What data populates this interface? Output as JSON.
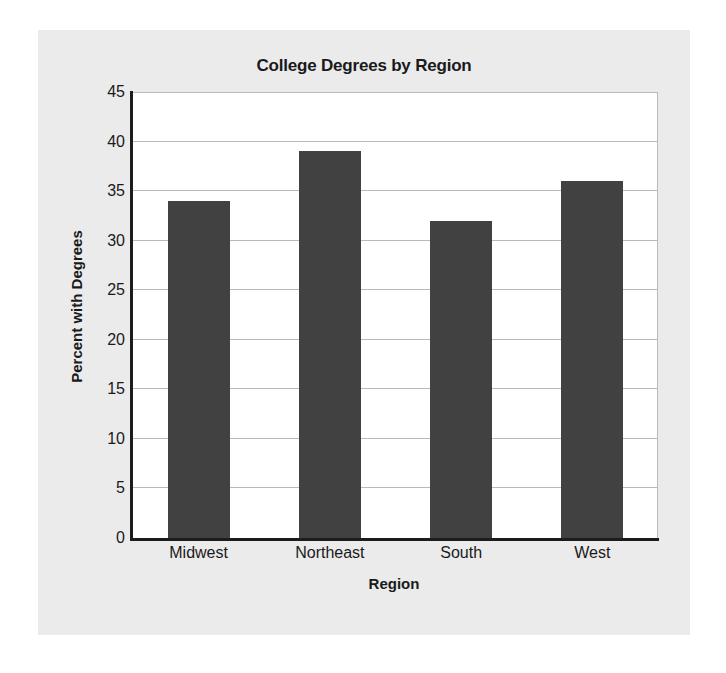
{
  "chart_data": {
    "type": "bar",
    "title": "College Degrees by Region",
    "xlabel": "Region",
    "ylabel": "Percent with Degrees",
    "categories": [
      "Midwest",
      "Northeast",
      "South",
      "West"
    ],
    "values": [
      34,
      39,
      32,
      36
    ],
    "ylim": [
      0,
      45
    ],
    "ytick_step": 5,
    "yticks": [
      45,
      40,
      35,
      30,
      25,
      20,
      15,
      10,
      5,
      0
    ],
    "grid": "horizontal",
    "legend": "none",
    "bar_color": "#414141",
    "plot_background": "#ffffff",
    "panel_background": "#ebebec",
    "axis_color": "#1c1c1c",
    "gridline_color": "#b9b9b9"
  }
}
